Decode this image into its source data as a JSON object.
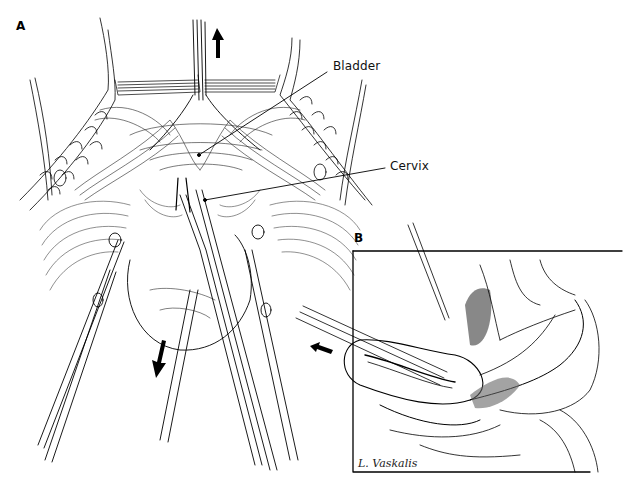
{
  "figure": {
    "panels": [
      {
        "id": "A",
        "label": "A"
      },
      {
        "id": "B",
        "label": "B"
      }
    ],
    "callouts": [
      {
        "label": "Bladder"
      },
      {
        "label": "Cervix"
      }
    ],
    "signature": "L. Vaskalis",
    "arrows": [
      {
        "name": "traction-up-arrow",
        "direction": "up"
      },
      {
        "name": "traction-down-arrow",
        "direction": "down-left"
      },
      {
        "name": "insertion-arrow",
        "direction": "up-left"
      }
    ],
    "colors": {
      "ink": "#000000",
      "background": "#ffffff",
      "hatch": "#555555"
    }
  }
}
